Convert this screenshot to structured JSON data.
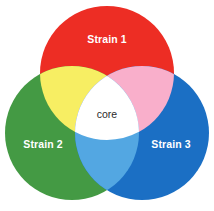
{
  "figure": {
    "type": "venn-diagram-3-set",
    "background_color": "#ffffff",
    "width": 214,
    "height": 211
  },
  "sets": [
    {
      "id": "strain-1",
      "label": "Strain 1",
      "color": "#ED2D24",
      "label_color": "#ffffff",
      "cx": 107,
      "cy": 73,
      "r": 67,
      "label_x": 107,
      "label_y": 40
    },
    {
      "id": "strain-2",
      "label": "Strain 2",
      "color": "#449A44",
      "label_color": "#ffffff",
      "cx": 72,
      "cy": 133,
      "r": 67,
      "label_x": 43,
      "label_y": 145
    },
    {
      "id": "strain-3",
      "label": "Strain 3",
      "color": "#1B6FC4",
      "label_color": "#ffffff",
      "cx": 142,
      "cy": 133,
      "r": 67,
      "label_x": 171,
      "label_y": 145
    }
  ],
  "intersections": [
    {
      "id": "strain1-strain2",
      "sets": "Strain 1 & Strain 2",
      "color": "#F7EE63"
    },
    {
      "id": "strain1-strain3",
      "sets": "Strain 1 & Strain 3",
      "color": "#F9AFCB"
    },
    {
      "id": "strain2-strain3",
      "sets": "Strain 2 & Strain 3",
      "color": "#53A7E2"
    }
  ],
  "core": {
    "id": "core",
    "label": "core",
    "sets": "Strain 1 & Strain 2 & Strain 3",
    "color": "#ffffff",
    "label_color": "#2b2b2b",
    "label_x": 107,
    "label_y": 115
  }
}
